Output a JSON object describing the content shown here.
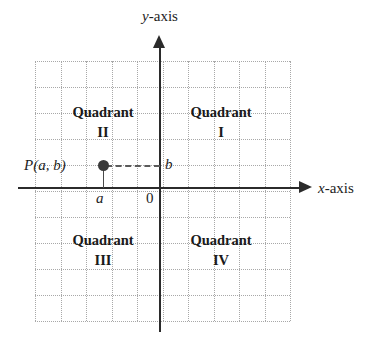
{
  "figure": {
    "type": "cartesian-coordinate-plane-diagram",
    "background_color": "#ffffff",
    "axis_color": "#2b2b2b",
    "grid_color": "#8c8c8c",
    "text_color": "#1d1d1d"
  },
  "axes": {
    "y_axis_label_variable": "y",
    "y_axis_label_suffix": "-axis",
    "x_axis_label_variable": "x",
    "x_axis_label_suffix": "-axis",
    "origin_label": "0"
  },
  "quadrants": [
    {
      "word": "Quadrant",
      "numeral": "I",
      "position": "top-right"
    },
    {
      "word": "Quadrant",
      "numeral": "II",
      "position": "top-left"
    },
    {
      "word": "Quadrant",
      "numeral": "III",
      "position": "bottom-left"
    },
    {
      "word": "Quadrant",
      "numeral": "IV",
      "position": "bottom-right"
    }
  ],
  "point": {
    "label": "P(a, b)",
    "x_coordinate_label": "a",
    "y_coordinate_label": "b"
  },
  "chart_data": {
    "type": "scatter",
    "title": "",
    "xlabel": "x-axis",
    "ylabel": "y-axis",
    "xlim": [
      -5,
      5
    ],
    "ylim": [
      -5,
      5
    ],
    "grid": true,
    "grid_columns": 10,
    "grid_rows": 10,
    "legend": "none",
    "points": [
      {
        "label": "P(a, b)",
        "x": -2.2,
        "y": 0.85
      }
    ],
    "annotations": [
      {
        "text": "Quadrant I",
        "x": 2.4,
        "y": 2.7
      },
      {
        "text": "Quadrant II",
        "x": -2.4,
        "y": 2.7
      },
      {
        "text": "Quadrant III",
        "x": -2.4,
        "y": -2.2
      },
      {
        "text": "Quadrant IV",
        "x": 2.4,
        "y": -2.2
      },
      {
        "text": "a",
        "x": -2.2,
        "y": -0.3
      },
      {
        "text": "b",
        "x": 0.3,
        "y": 0.85
      },
      {
        "text": "0",
        "x": -0.3,
        "y": -0.3
      }
    ],
    "guide_lines": [
      {
        "from": [
          -2.2,
          0.85
        ],
        "to": [
          0,
          0.85
        ],
        "style": "dashed"
      },
      {
        "from": [
          -2.2,
          0.85
        ],
        "to": [
          -2.2,
          0
        ],
        "style": "solid"
      }
    ]
  }
}
